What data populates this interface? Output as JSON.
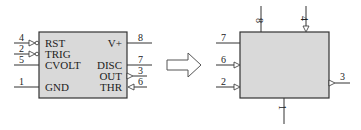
{
  "colors": {
    "box_fill": "#d9d9d9",
    "stroke": "#333333",
    "background": "#ffffff"
  },
  "left_chip": {
    "pins_left": [
      {
        "number": "4",
        "label": "RST",
        "inverted": true
      },
      {
        "number": "2",
        "label": "TRIG",
        "inverted": true
      },
      {
        "number": "5",
        "label": "CVOLT",
        "inverted": false
      },
      {
        "number": "1",
        "label": "GND",
        "inverted": false
      }
    ],
    "pins_right": [
      {
        "number": "8",
        "label": "V+"
      },
      {
        "number": "7",
        "label": "DISC"
      },
      {
        "number": "3",
        "label": "OUT"
      },
      {
        "number": "6",
        "label": "THR"
      }
    ]
  },
  "arrow": {
    "icon": "right-arrow-icon"
  },
  "right_block": {
    "top_pins": [
      "8",
      "4"
    ],
    "left_pins": [
      "7",
      "6",
      "2"
    ],
    "right_pins": [
      "3"
    ],
    "bottom_pins": [
      "1"
    ]
  }
}
